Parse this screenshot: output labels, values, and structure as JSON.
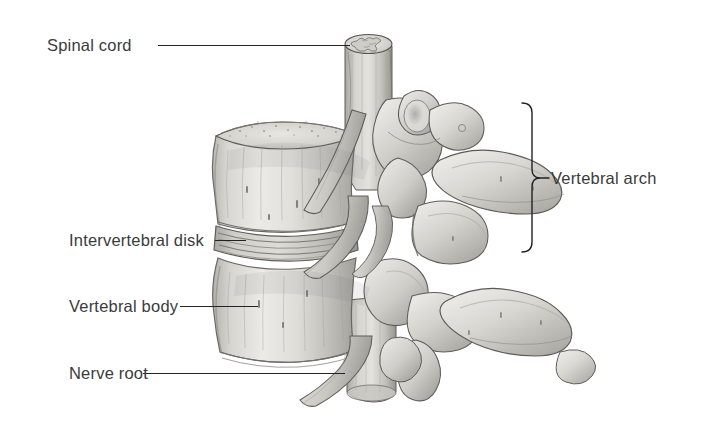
{
  "figure": {
    "background_color": "#ffffff",
    "ink_color": "#23231f",
    "label_color": "#3b3b3d",
    "bone_light": "#efeeea",
    "bone_mid": "#c9c7c2",
    "bone_shadow": "#8e8c88",
    "cord_color": "#bfbdb8"
  },
  "labels": {
    "spinal_cord": "Spinal cord",
    "intervertebral_disk": "Intervertebral disk",
    "vertebral_body": "Vertebral body",
    "nerve_root": "Nerve root",
    "vertebral_arch": "Vertebral arch"
  },
  "structures": [
    {
      "name": "spinal-cord",
      "label": "Spinal cord"
    },
    {
      "name": "intervertebral-disk",
      "label": "Intervertebral disk"
    },
    {
      "name": "vertebral-body",
      "label": "Vertebral body"
    },
    {
      "name": "nerve-root",
      "label": "Nerve root"
    },
    {
      "name": "vertebral-arch",
      "label": "Vertebral arch"
    }
  ]
}
